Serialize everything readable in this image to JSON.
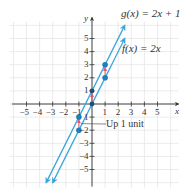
{
  "chart_data": {
    "type": "line",
    "title": "",
    "xlabel": "x",
    "ylabel": "y",
    "xlim": [
      -6.2,
      6.6
    ],
    "ylim": [
      -6.4,
      6.4
    ],
    "grid": true,
    "x_ticks": [
      -5,
      -4,
      -3,
      -2,
      -1,
      1,
      2,
      3,
      4,
      5
    ],
    "y_ticks": [
      -5,
      -4,
      -3,
      -2,
      -1,
      1,
      2,
      3,
      4,
      5
    ],
    "x_tick_labels": [
      "−5",
      "−4",
      "−3",
      "−2",
      "−1",
      "1",
      "2",
      "3",
      "4",
      "5"
    ],
    "y_tick_labels": [
      "−5",
      "−4",
      "−3",
      "−2",
      "−1",
      "1",
      "2",
      "3",
      "4",
      "5"
    ],
    "series": [
      {
        "name": "g(x) = 2x + 1",
        "slope": 2,
        "intercept": 1,
        "x": [
          -3.5,
          2.5
        ],
        "y": [
          -6,
          6
        ],
        "points": [
          [
            -1,
            -1
          ],
          [
            0,
            1
          ],
          [
            1,
            3
          ]
        ],
        "color": "#3aa6dc"
      },
      {
        "name": "f(x) = 2x",
        "slope": 2,
        "intercept": 0,
        "x": [
          -3,
          2.5
        ],
        "y": [
          -6,
          5
        ],
        "points": [
          [
            -1,
            -2
          ],
          [
            0,
            0
          ],
          [
            1,
            2
          ]
        ],
        "color": "#3aa6dc"
      }
    ],
    "annotations": [
      {
        "text": "Up 1 unit",
        "from": [
          -1,
          -2
        ],
        "to": [
          -1,
          -1
        ],
        "color": "#e0566a"
      },
      {
        "text": "",
        "from": [
          0,
          0
        ],
        "to": [
          0,
          1
        ],
        "color": "#e0566a"
      },
      {
        "text": "",
        "from": [
          1,
          2
        ],
        "to": [
          1,
          3
        ],
        "color": "#e0566a"
      }
    ]
  },
  "labels": {
    "g_equation": "g(x) = 2x + 1",
    "f_equation": "f(x) = 2x",
    "annotation": "Up 1 unit",
    "x_axis": "x",
    "y_axis": "y"
  },
  "colors": {
    "line": "#3aa6dc",
    "point": "#1e7fc0",
    "shift_arrow": "#e0566a",
    "grid": "#e6e6e6",
    "axis": "#333333"
  }
}
